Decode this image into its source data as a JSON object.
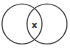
{
  "diagram": {
    "type": "venn",
    "sets": [
      {
        "name": "left-set",
        "cx": 22,
        "cy": 24,
        "r": 20
      },
      {
        "name": "right-set",
        "cx": 47,
        "cy": 24,
        "r": 20
      }
    ],
    "intersection_label": "x",
    "stroke_color": "#444444",
    "background": "#ffffff"
  }
}
